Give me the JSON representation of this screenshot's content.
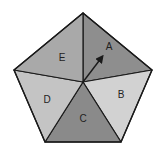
{
  "diagram": {
    "type": "pentagon-sections",
    "center": [
      83,
      82
    ],
    "vertices": {
      "top": [
        83,
        13
      ],
      "right": [
        152,
        70
      ],
      "bottom_right": [
        121,
        142
      ],
      "bottom_left": [
        45,
        142
      ],
      "left": [
        14,
        70
      ]
    },
    "stroke_color": "#1a1a1a",
    "sections": [
      {
        "label": "A",
        "fill": "#8e8e8e",
        "label_pos": [
          109,
          50
        ]
      },
      {
        "label": "B",
        "fill": "#d2d2d2",
        "label_pos": [
          121,
          98
        ]
      },
      {
        "label": "C",
        "fill": "#8a8a8a",
        "label_pos": [
          83,
          122
        ]
      },
      {
        "label": "D",
        "fill": "#c4c4c4",
        "label_pos": [
          47,
          103
        ]
      },
      {
        "label": "E",
        "fill": "#a9a9a9",
        "label_pos": [
          62,
          61
        ]
      }
    ],
    "arrow": {
      "from": [
        83,
        82
      ],
      "to": [
        104,
        54
      ],
      "color": "#1a1a1a"
    }
  }
}
